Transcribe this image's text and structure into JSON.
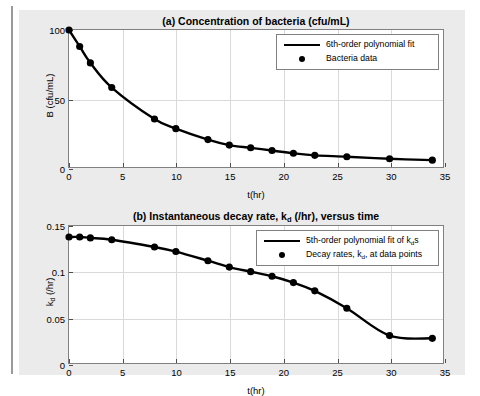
{
  "page": {
    "clipped_top_text": "",
    "background": "#ffffff",
    "figure_background": "#ebebeb",
    "axes_background": "#ffffff",
    "line_color": "#000000",
    "marker_color": "#000000",
    "grid_color": "#d9d9d9",
    "axis_color": "#808080"
  },
  "chart_data": [
    {
      "id": "a",
      "type": "line",
      "title": "(a) Concentration of bacteria (cfu/mL)",
      "xlabel": "t(hr)",
      "ylabel": "B (cfu/mL)",
      "xlim": [
        0,
        35
      ],
      "ylim": [
        0,
        100
      ],
      "xticks": [
        0,
        5,
        10,
        15,
        20,
        25,
        30,
        35
      ],
      "xticklabels": [
        "0",
        "5",
        "10",
        "15",
        "20",
        "25",
        "30",
        "35"
      ],
      "yticks": [
        0,
        50,
        100
      ],
      "yticklabels": [
        "0",
        "50",
        "100"
      ],
      "grid": true,
      "legend_position": "northeast",
      "series": [
        {
          "name": "6th-order polynomial fit",
          "style": "line",
          "x": [
            0,
            1,
            2,
            4,
            8,
            10,
            13,
            15,
            17,
            19,
            21,
            23,
            26,
            30,
            34
          ],
          "y": [
            100,
            88,
            76,
            58,
            35,
            28,
            20,
            16,
            14,
            12,
            10,
            8.5,
            7.5,
            6,
            5
          ]
        },
        {
          "name": "Bacteria data",
          "style": "marker",
          "x": [
            0,
            1,
            2,
            4,
            8,
            10,
            13,
            15,
            17,
            19,
            21,
            23,
            26,
            30,
            34
          ],
          "y": [
            100,
            88,
            76,
            58,
            35,
            28,
            20,
            16,
            14,
            12,
            10,
            8.5,
            7.5,
            6,
            5
          ]
        }
      ],
      "legend": [
        {
          "label": "6th-order polynomial fit",
          "key": "line"
        },
        {
          "label": "Bacteria data",
          "key": "dot"
        }
      ]
    },
    {
      "id": "b",
      "type": "line",
      "title_parts": [
        "(b) Instantaneous decay rate, k",
        "d",
        " (/hr), versus time"
      ],
      "title": "(b) Instantaneous decay rate, k_d (/hr), versus time",
      "xlabel": "t(hr)",
      "ylabel": "k_d (/hr)",
      "ylabel_parts": [
        "k",
        "d",
        " (/hr)"
      ],
      "xlim": [
        0,
        35
      ],
      "ylim": [
        0,
        0.15
      ],
      "xticks": [
        0,
        5,
        10,
        15,
        20,
        25,
        30,
        35
      ],
      "xticklabels": [
        "0",
        "5",
        "10",
        "15",
        "20",
        "25",
        "30",
        "35"
      ],
      "yticks": [
        0,
        0.05,
        0.1,
        0.15
      ],
      "yticklabels": [
        "0",
        "0.05",
        "0.1",
        "0.15"
      ],
      "grid": true,
      "legend_position": "northeast",
      "series": [
        {
          "name": "5th-order polynomial fit of k_d s",
          "style": "line",
          "x": [
            0,
            1,
            2,
            4,
            8,
            10,
            13,
            15,
            17,
            19,
            21,
            23,
            26,
            30,
            34
          ],
          "y": [
            0.138,
            0.138,
            0.137,
            0.135,
            0.127,
            0.122,
            0.112,
            0.105,
            0.1,
            0.095,
            0.088,
            0.079,
            0.06,
            0.03,
            0.027
          ]
        },
        {
          "name": "Decay rates, k_d, at data points",
          "style": "marker",
          "x": [
            0,
            1,
            2,
            4,
            8,
            10,
            13,
            15,
            17,
            19,
            21,
            23,
            26,
            30,
            34
          ],
          "y": [
            0.138,
            0.138,
            0.137,
            0.135,
            0.127,
            0.122,
            0.112,
            0.105,
            0.1,
            0.095,
            0.088,
            0.079,
            0.06,
            0.03,
            0.027
          ]
        }
      ],
      "legend": [
        {
          "label_parts": [
            "5th-order polynomial fit of k",
            "d",
            "s"
          ],
          "label": "5th-order polynomial fit of k_d s",
          "key": "line"
        },
        {
          "label_parts": [
            "Decay rates, k",
            "d",
            ", at data points"
          ],
          "label": "Decay rates, k_d, at data points",
          "key": "dot"
        }
      ]
    }
  ]
}
